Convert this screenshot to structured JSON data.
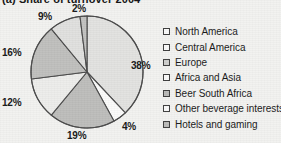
{
  "chart_data": {
    "type": "pie",
    "title": "(a) Share of turnover 2004",
    "categories": [
      "North America",
      "Central America",
      "Europe",
      "Africa and Asia",
      "Beer South Africa",
      "Other beverage interests",
      "Hotels and gaming"
    ],
    "values": [
      38,
      4,
      19,
      12,
      16,
      9,
      2
    ],
    "value_labels": [
      "38%",
      "4%",
      "19%",
      "12%",
      "16%",
      "9%",
      "2%"
    ],
    "unit": "%",
    "start_angle_deg": 0,
    "direction": "clockwise",
    "legend_position": "right",
    "grid": false,
    "xlabel": "",
    "ylabel": "",
    "slice_colors": [
      "#e2e2e0",
      "#fbfbfa",
      "#bdbdbb",
      "#ededeb",
      "#bfbfbd",
      "#e0e0de",
      "#c2c2c0"
    ],
    "legend_swatch_colors": [
      "#fafafa",
      "#fafafa",
      "#cfcfcd",
      "#fafafa",
      "#b9b9b7",
      "#fafafa",
      "#bcbcba"
    ],
    "outline_color": "#4a4a4a"
  },
  "labels": {
    "north_america": "38%",
    "central_america": "4%",
    "europe": "19%",
    "africa_and_asia": "12%",
    "beer_south_africa": "16%",
    "other_beverage_interests": "9%",
    "hotels_and_gaming": "2%"
  }
}
